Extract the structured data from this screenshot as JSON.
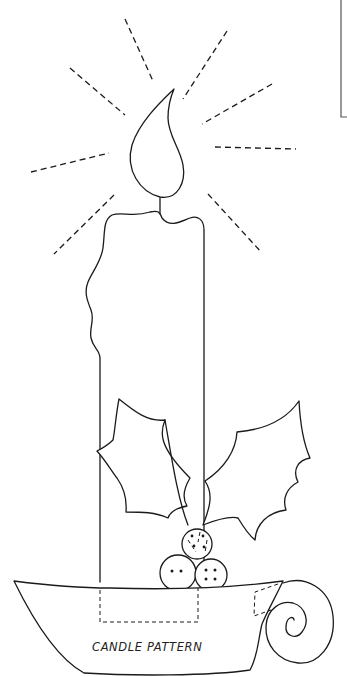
{
  "pattern": {
    "title": "CANDLE PATTERN",
    "subject": "candle-with-holly-in-candleholder",
    "line_color": "#1a1a1a",
    "background_color": "#ffffff",
    "elements": {
      "rays": 9,
      "flame": 1,
      "candle": 1,
      "holly_leaves": 2,
      "berries": [
        {
          "name": "top-berry",
          "holes": 4,
          "dashed_stitch": true
        },
        {
          "name": "left-berry",
          "holes": 2
        },
        {
          "name": "right-berry",
          "holes": 4
        }
      ],
      "holder": {
        "has_handle": true,
        "dashed_placement_marks": 2
      }
    }
  }
}
